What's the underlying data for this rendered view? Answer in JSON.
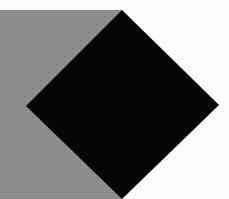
{
  "scene": {
    "background_color": "#fcfcfc",
    "gray_rect": {
      "x": 0,
      "y": 10,
      "width": 122,
      "height": 189,
      "color": "#8c8c8c"
    },
    "diamond": {
      "points": [
        [
          122,
          10
        ],
        [
          219,
          105
        ],
        [
          122,
          199
        ],
        [
          26,
          106
        ]
      ],
      "color": "#050505"
    }
  }
}
